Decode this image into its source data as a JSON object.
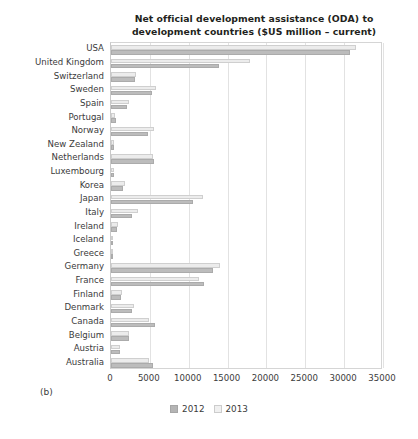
{
  "figure": {
    "panel_label": "(b)"
  },
  "chart_data": {
    "type": "bar",
    "orientation": "horizontal",
    "title": "Net official development assistance (ODA) to development countries ($US million – current)",
    "title_line1": "Net official development assistance (ODA) to",
    "title_line2": "development countries ($US million – current)",
    "xlabel": "",
    "ylabel": "",
    "xlim": [
      0,
      35000
    ],
    "xticks": [
      0,
      5000,
      10000,
      15000,
      20000,
      25000,
      30000,
      35000
    ],
    "xtick_labels": [
      "0",
      "5000",
      "10000",
      "15000",
      "20000",
      "25000",
      "30000",
      "35000"
    ],
    "grid": true,
    "legend_position": "bottom",
    "categories": [
      "USA",
      "United Kingdom",
      "Switzerland",
      "Sweden",
      "Spain",
      "Portugal",
      "Norway",
      "New Zealand",
      "Netherlands",
      "Luxembourg",
      "Korea",
      "Japan",
      "Italy",
      "Ireland",
      "Iceland",
      "Greece",
      "Germany",
      "France",
      "Finland",
      "Denmark",
      "Canada",
      "Belgium",
      "Austria",
      "Australia"
    ],
    "series": [
      {
        "name": "2012",
        "color": "#bcbcbc",
        "values": [
          30700,
          13900,
          3050,
          5250,
          2040,
          580,
          4750,
          450,
          5520,
          400,
          1600,
          10600,
          2700,
          800,
          26,
          320,
          13100,
          12000,
          1320,
          2700,
          5650,
          2300,
          1110,
          5400
        ]
      },
      {
        "name": "2013",
        "color": "#ececec",
        "values": [
          31500,
          17900,
          3200,
          5800,
          2380,
          490,
          5580,
          450,
          5440,
          430,
          1740,
          11790,
          3430,
          850,
          35,
          240,
          14000,
          11380,
          1440,
          2930,
          4910,
          2300,
          1170,
          4850
        ]
      }
    ],
    "legend": [
      {
        "label": "2012",
        "color": "#b4b4b4"
      },
      {
        "label": "2013",
        "color": "#f0f0f0"
      }
    ]
  }
}
